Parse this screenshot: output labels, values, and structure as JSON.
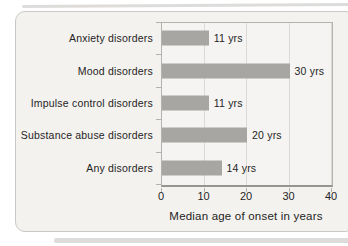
{
  "chart_data": {
    "type": "bar",
    "orientation": "horizontal",
    "categories": [
      "Anxiety disorders",
      "Mood disorders",
      "Impulse control disorders",
      "Substance abuse disorders",
      "Any disorders"
    ],
    "values": [
      11,
      30,
      11,
      20,
      14
    ],
    "value_labels": [
      "11 yrs",
      "30 yrs",
      "11 yrs",
      "20 yrs",
      "14 yrs"
    ],
    "xlabel": "Median age of onset in years",
    "xlim": [
      0,
      40
    ],
    "xticks": [
      0,
      10,
      20,
      30,
      40
    ],
    "grid": true,
    "legend": "none",
    "colors": {
      "bar": "#a8a6a3",
      "plot_bg": "#f6f4f2",
      "card_bg": "#f4f2ef",
      "grid": "#dcdad7",
      "axis": "#b4b2af",
      "text": "#242424",
      "strip": "#d8d6d3"
    }
  }
}
